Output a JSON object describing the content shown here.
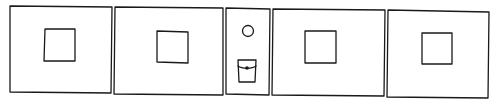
{
  "diagram": {
    "stroke_color": "#1a1a1a",
    "background": "#ffffff",
    "panels": [
      {
        "id": "panel-1",
        "x": 10,
        "y": 6,
        "w": 102,
        "h": 87,
        "content": "square"
      },
      {
        "id": "panel-2",
        "x": 114,
        "y": 7,
        "w": 109,
        "h": 87,
        "content": "square"
      },
      {
        "id": "panel-3",
        "x": 226,
        "y": 8,
        "w": 44,
        "h": 86,
        "content": "circle-and-pocket"
      },
      {
        "id": "panel-4",
        "x": 272,
        "y": 9,
        "w": 113,
        "h": 86,
        "content": "square"
      },
      {
        "id": "panel-5",
        "x": 387,
        "y": 10,
        "w": 103,
        "h": 86,
        "content": "square"
      }
    ]
  }
}
